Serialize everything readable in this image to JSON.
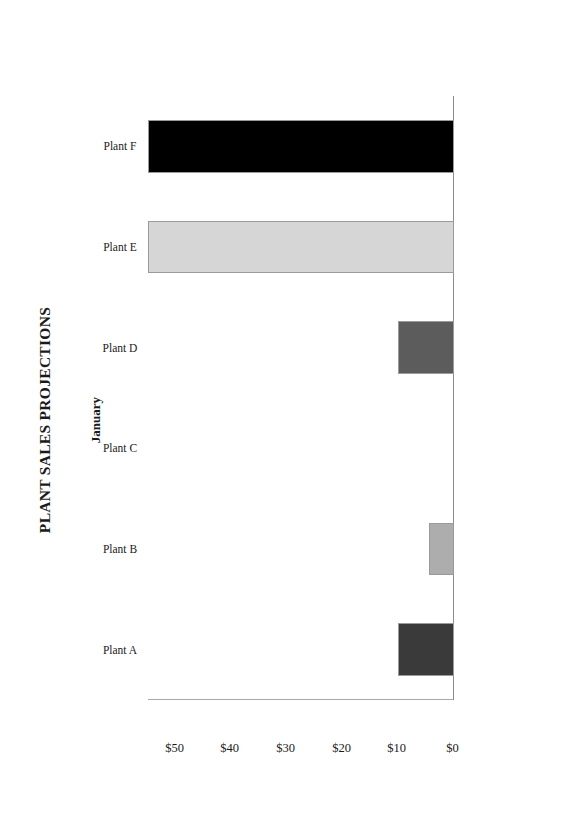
{
  "document": {
    "page_background": "#ffffff"
  },
  "chart_data": {
    "type": "bar",
    "title": "PLANT SALES PROJECTIONS",
    "subtitle": "January",
    "orientation": "vertical-columns-on-rotated-landscape-page",
    "categories": [
      "Plant A",
      "Plant B",
      "Plant C",
      "Plant D",
      "Plant E",
      "Plant F"
    ],
    "values": [
      10,
      4.5,
      0,
      10,
      55,
      55
    ],
    "value_prefix": "$",
    "xlabel": "",
    "ylabel": "",
    "ylim": [
      0,
      55
    ],
    "ytick_labels": [
      "$0",
      "$10",
      "$20",
      "$30",
      "$40",
      "$50"
    ],
    "ytick_values": [
      0,
      10,
      20,
      30,
      40,
      50
    ],
    "grid": false,
    "legend": false,
    "series": [
      {
        "name": "January",
        "values": [
          10,
          4.5,
          0,
          10,
          55,
          55
        ]
      }
    ],
    "bar_colors": [
      "#3a3a3a",
      "#adadad",
      "#ffffff",
      "#5c5c5c",
      "#d6d6d6",
      "#000000"
    ],
    "bar_border_color": "#9a9a9a",
    "axis_color": "#8c8c8c"
  }
}
